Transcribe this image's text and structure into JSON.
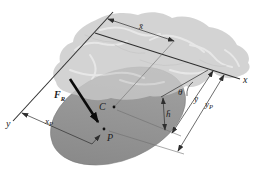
{
  "figure": {
    "labels": {
      "x_axis": "x",
      "y_axis": "y",
      "x_bar": "x̄",
      "y_bar": "ȳ",
      "h_bar": "h̄",
      "theta": "θ",
      "centroid": "C",
      "pressure_point": "P",
      "force": {
        "base": "F",
        "sub": "R"
      },
      "x_p": {
        "base": "x",
        "sub": "P"
      },
      "y_p": {
        "base": "y",
        "sub": "P"
      }
    },
    "colors": {
      "background": "#ffffff",
      "water_surface": "#c9c9c9",
      "water_texture_light": "#e2e2e2",
      "water_texture_dark": "#bdbdbd",
      "plate_light": "#a6a6a6",
      "plate_dark": "#858585",
      "line": "#2e2e2e",
      "leader": "#6e6e6e",
      "force_arrow": "#0b0b0b"
    }
  }
}
